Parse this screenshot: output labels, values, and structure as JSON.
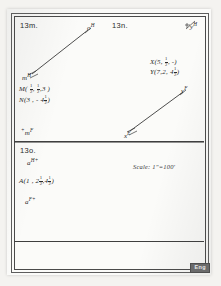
{
  "document": {
    "type": "scanned-worksheet-page",
    "stamp_label": "Eng"
  },
  "problems": [
    {
      "id": "13m",
      "label": "13m."
    },
    {
      "id": "13n",
      "label": "13n."
    },
    {
      "id": "13o",
      "label": "13o."
    }
  ],
  "problem_13m": {
    "label": "13m.",
    "axis_origin_label": "m",
    "axis_origin_sup": "H",
    "axis_tip_label": "o",
    "axis_tip_sup": "H",
    "point_M": {
      "name": "M",
      "open": "(",
      "x": "1/2",
      "y": "1/2",
      "z": "3",
      "close": ")",
      "text": "M( 1/2 , 1/2 , 3 )"
    },
    "point_N": {
      "name": "N",
      "open": "(",
      "x": "3",
      "y": "-",
      "z": "4 1/2",
      "close": ")",
      "text": "N(3 , - 4 1/2 )"
    },
    "bottom_axis_label": "m",
    "bottom_axis_sup": "F",
    "bottom_axis_plus": "+"
  },
  "problem_13n": {
    "label": "13n.",
    "axis_plus": "+",
    "axis_label": "y",
    "axis_sup": "H",
    "point_X": {
      "name": "X",
      "text": "X(5, 1/2, -)"
    },
    "point_Y": {
      "name": "Y",
      "text": "Y(7,2, 4 1/2)"
    },
    "vector_tail_label": "x",
    "vector_tail_sup": "E",
    "vector_head_label": "y",
    "vector_head_sup": "F"
  },
  "problem_13o": {
    "label": "13o.",
    "scale_text": "Scale: 1\"=100'",
    "top_label": "a",
    "top_sup": "H",
    "top_plus": "+",
    "point_A": {
      "name": "A",
      "text": "A(1 , 2 1/2 , 4 1/2 )"
    },
    "bottom_label": "a",
    "bottom_sup": "F",
    "bottom_plus": "+"
  },
  "fractions": {
    "half": {
      "n": "1",
      "d": "2"
    },
    "four_and_half_whole": "4",
    "two_and_half_whole": "2"
  },
  "colors": {
    "paper": "#fbfbf9",
    "ink": "#2c2c2c",
    "rule": "#4a4a4a",
    "stamp_bg": "#6b6b6b"
  }
}
